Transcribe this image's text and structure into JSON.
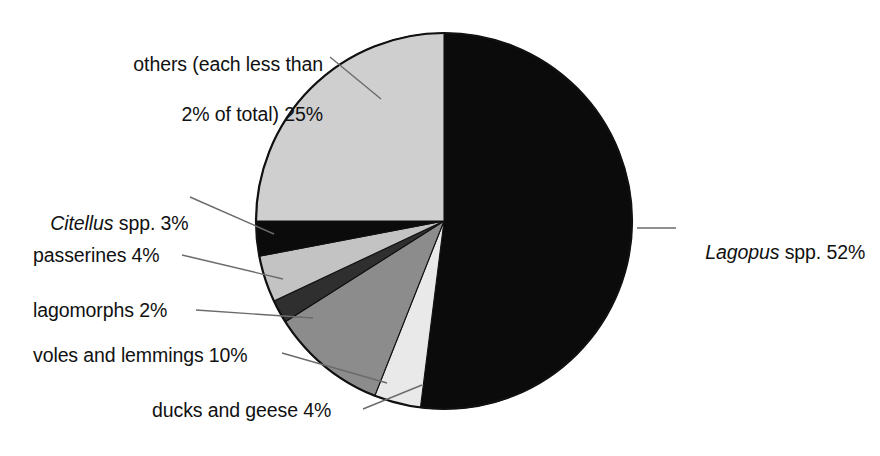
{
  "chart_data": {
    "type": "pie",
    "title": "",
    "subtitle": "",
    "xlabel": "",
    "ylabel": "",
    "legend_position": "none",
    "grid": false,
    "units": "percent",
    "start_angle_deg": 0,
    "direction": "clockwise",
    "categories": [
      "Lagopus spp.",
      "ducks and geese",
      "voles and lemmings",
      "lagomorphs",
      "passerines",
      "Citellus spp.",
      "others (each less than 2% of total)"
    ],
    "values": [
      52,
      4,
      10,
      2,
      4,
      3,
      25
    ],
    "slices": [
      {
        "key": "lagopus",
        "label_text": "Lagopus spp. 52%",
        "name_italic": "Lagopus",
        "name_roman": " spp.",
        "value_text": "52%",
        "value": 52,
        "color": "#0b0b0b",
        "start_deg": 0,
        "end_deg": 187.2,
        "label_side": "right"
      },
      {
        "key": "ducks-and-geese",
        "label_text": "ducks and geese 4%",
        "name_italic": "",
        "name_roman": "ducks and geese",
        "value_text": "4%",
        "value": 4,
        "color": "#e9e9e9",
        "start_deg": 187.2,
        "end_deg": 201.6,
        "label_side": "bottom"
      },
      {
        "key": "voles-and-lemmings",
        "label_text": "voles and lemmings 10%",
        "name_italic": "",
        "name_roman": "voles and lemmings",
        "value_text": "10%",
        "value": 10,
        "color": "#8c8c8c",
        "start_deg": 201.6,
        "end_deg": 237.6,
        "label_side": "left"
      },
      {
        "key": "lagomorphs",
        "label_text": "lagomorphs 2%",
        "name_italic": "",
        "name_roman": "lagomorphs",
        "value_text": "2%",
        "value": 2,
        "color": "#2f2f2f",
        "start_deg": 237.6,
        "end_deg": 244.8,
        "label_side": "left"
      },
      {
        "key": "passerines",
        "label_text": "passerines 4%",
        "name_italic": "",
        "name_roman": "passerines",
        "value_text": "4%",
        "value": 4,
        "color": "#c3c3c3",
        "start_deg": 244.8,
        "end_deg": 259.2,
        "label_side": "left"
      },
      {
        "key": "citellus",
        "label_text": "Citellus spp. 3%",
        "name_italic": "Citellus",
        "name_roman": " spp.",
        "value_text": "3%",
        "value": 3,
        "color": "#0b0b0b",
        "start_deg": 259.2,
        "end_deg": 270,
        "label_side": "left"
      },
      {
        "key": "others",
        "label_text": "others (each less than 2% of total) 25%",
        "name_italic": "",
        "name_roman": "others (each less than 2% of total)",
        "value_text": "25%",
        "value": 25,
        "color": "#cfcfcf",
        "start_deg": 270,
        "end_deg": 360,
        "label_side": "top-left"
      }
    ]
  },
  "labels": {
    "others_line1": "others (each less than",
    "others_line2": "2% of total) 25%",
    "citellus_italic": "Citellus",
    "citellus_rest": " spp. 3%",
    "passerines": "passerines 4%",
    "lagomorphs": "lagomorphs 2%",
    "voles": "voles and lemmings 10%",
    "ducks": "ducks and geese 4%",
    "lagopus_italic": "Lagopus",
    "lagopus_rest": " spp. 52%"
  },
  "style": {
    "background": "#ffffff",
    "outline": "#111111",
    "leader_line": "#6b6b6b",
    "text": "#111111"
  }
}
